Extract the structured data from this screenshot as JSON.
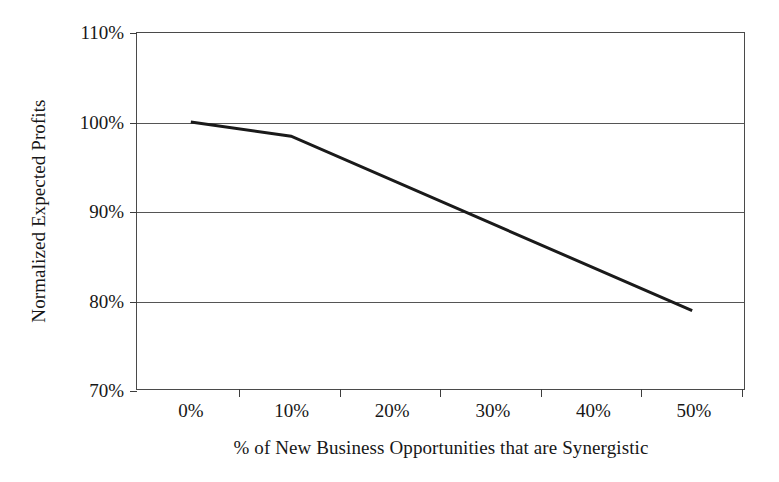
{
  "chart_data": {
    "type": "line",
    "title": "",
    "subtitle": "",
    "xlabel": "% of New Business Opportunities that are Synergistic",
    "ylabel": "Normalized Expected Profits",
    "xlim": [
      0,
      50
    ],
    "ylim": [
      70,
      110
    ],
    "xtick_labels": [
      "0%",
      "10%",
      "20%",
      "30%",
      "40%",
      "50%"
    ],
    "xticks": [
      0,
      10,
      20,
      30,
      40,
      50
    ],
    "ytick_labels": [
      "70%",
      "80%",
      "90%",
      "100%",
      "110%"
    ],
    "yticks": [
      70,
      80,
      90,
      100,
      110
    ],
    "grid": "horizontal",
    "legend": "none",
    "line_color": "#1a1a1a",
    "series": [
      {
        "name": "Normalized Expected Profits",
        "x": [
          0,
          10,
          50
        ],
        "values": [
          100,
          98.4,
          78.8
        ],
        "points": [
          {
            "x": 0,
            "y": 100
          },
          {
            "x": 10,
            "y": 98.4
          },
          {
            "x": 50,
            "y": 78.8
          }
        ]
      }
    ],
    "annotations": []
  }
}
